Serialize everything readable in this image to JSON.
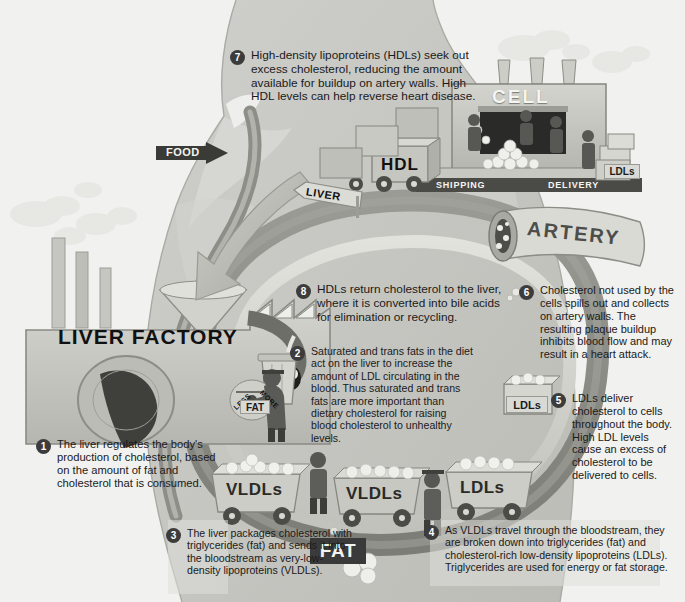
{
  "figure": {
    "palette": {
      "page_background": "#f2f2f0",
      "body_silhouette": "#c9c9c5",
      "body_outline": "#a8a8a2",
      "vessel_dark": "#8a8a84",
      "vessel_light": "#d6d6d1",
      "ink": "#1a1a1a",
      "badge": "#3c3c3c",
      "badge_text": "#ffffff",
      "sign_dark": "#3a3a3a",
      "sign_light": "#d9d9d5"
    }
  },
  "callouts": [
    {
      "num": "1",
      "text": "The liver regulates the body's production of cholesterol, based on the amount of fat and cholesterol that is consumed."
    },
    {
      "num": "2",
      "text": "Saturated and trans fats in the diet act on the liver to increase the amount of LDL circulating in the blood. Thus saturated and trans fats are more important than dietary cholesterol for raising blood cholesterol to unhealthy  levels."
    },
    {
      "num": "3",
      "text": "The liver packages cholesterol with triglycerides (fat) and sends it into the bloodstream as very-low-density lipoproteins (VLDLs)."
    },
    {
      "num": "4",
      "text": "As VLDLs travel through the bloodstream, they are broken down into triglycerides (fat) and cholesterol-rich low-density lipoproteins (LDLs). Triglycerides are used for energy or fat storage."
    },
    {
      "num": "5",
      "text": "LDLs deliver cholesterol to cells throughout the body. High LDL levels cause an excess of cholesterol to be delivered to cells."
    },
    {
      "num": "6",
      "text": "Cholesterol not used by the cells spills out and collects on artery walls. The resulting plaque buildup inhibits blood flow and may result in a heart attack."
    },
    {
      "num": "7",
      "text": "High-density lipoproteins (HDLs) seek out excess cholesterol, reducing the amount available for buildup on artery walls. High HDL levels can help reverse heart disease."
    },
    {
      "num": "8",
      "text": "HDLs return cholesterol to the liver, where it is converted into bile acids for elimination or recycling."
    }
  ],
  "scene_labels": {
    "food_arrow": "FOOD",
    "liver_sign": "LIVER",
    "liver_factory": "LIVER FACTORY",
    "dial_less": "LESS",
    "dial_more": "MORE",
    "fat_worker_sign": "FAT",
    "cell_building": "CELL",
    "shipping_dock": "SHIPPING",
    "delivery_dock": "DELIVERY",
    "hdl_truck": "HDL",
    "ldl_boxes": "LDLs",
    "artery": "ARTERY",
    "ldl_crate_left": "LDLs",
    "cart_vldl_1": "VLDLs",
    "cart_vldl_2": "VLDLs",
    "cart_ldl": "LDLs",
    "fat_sign": "FAT"
  },
  "icons": {
    "food_arrow": "right-arrow-icon",
    "liver_sign": "left-arrow-sign-icon",
    "funnel": "funnel-icon",
    "smokestack": "smokestack-icon",
    "smoke_cloud": "cloud-icon",
    "dial": "gauge-icon",
    "trash_can": "trash-can-icon",
    "worker": "worker-figure-icon",
    "cart": "mine-cart-icon",
    "truck": "truck-icon",
    "crate": "crate-icon",
    "cholesterol_ball": "sphere-icon",
    "artery_cross_section": "artery-icon",
    "plaque": "plaque-icon",
    "big_arrow": "curved-arrow-icon"
  }
}
